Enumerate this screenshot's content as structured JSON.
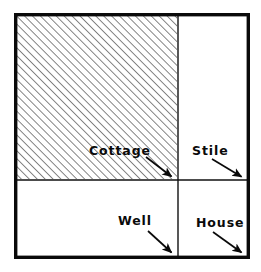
{
  "diagram": {
    "type": "plan-map",
    "colors": {
      "ink": "#0a0a0a",
      "paper": "#ffffff",
      "hatch": "#2b2b2b",
      "divider": "#111111"
    },
    "frame": {
      "name": "outer-boundary",
      "x": 14,
      "y": 13,
      "width": 234,
      "height": 244,
      "stroke_width": 3.5
    },
    "dividers": [
      {
        "name": "vertical-divider",
        "orientation": "vertical",
        "position": 178,
        "stroke_width": 1.4
      },
      {
        "name": "horizontal-divider",
        "orientation": "horizontal",
        "position": 180,
        "stroke_width": 1.4
      }
    ],
    "hatched_region": {
      "name": "cottage-plot",
      "x": 16,
      "y": 15,
      "width": 162,
      "height": 165,
      "pattern": "diagonal-hatch-45",
      "spacing": 5.6,
      "angle_degrees": 45
    },
    "regions": [
      {
        "id": "cottage",
        "label": "Cottage",
        "hatched": true,
        "label_x": 89,
        "label_y": 145,
        "arrow": {
          "x1": 146,
          "y1": 157,
          "x2": 173,
          "y2": 178
        }
      },
      {
        "id": "stile",
        "label": "Stile",
        "hatched": false,
        "label_x": 192,
        "label_y": 145,
        "arrow": {
          "x1": 212,
          "y1": 159,
          "x2": 243,
          "y2": 178
        }
      },
      {
        "id": "well",
        "label": "Well",
        "hatched": false,
        "label_x": 118,
        "label_y": 215,
        "arrow": {
          "x1": 148,
          "y1": 231,
          "x2": 173,
          "y2": 254
        }
      },
      {
        "id": "house",
        "label": "House",
        "hatched": false,
        "label_x": 196,
        "label_y": 217,
        "arrow": {
          "x1": 213,
          "y1": 232,
          "x2": 243,
          "y2": 254
        }
      }
    ]
  }
}
